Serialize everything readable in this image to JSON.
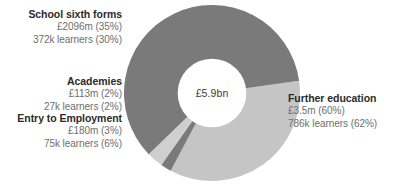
{
  "center": {
    "value": "£5.9bn"
  },
  "colors": {
    "light_grey": "#c5c5c5",
    "mid_light_grey": "#cfcfcf",
    "dark_grey": "#7a7a7a",
    "mid_dark_grey": "#8a8a8a",
    "title_text": "#2b2b2b",
    "value_text": "#6e6e6e",
    "background": "#ffffff"
  },
  "labels": {
    "school": {
      "title": "School sixth forms",
      "amount": "£2096m (35%)",
      "learners": "372k learners (30%)"
    },
    "academies": {
      "title": "Academies",
      "amount": "£113m (2%)",
      "learners": "27k learners (2%)"
    },
    "entry": {
      "title": "Entry to Employment",
      "amount": "£180m (3%)",
      "learners": "75k learners (6%)"
    },
    "further": {
      "title": "Further education",
      "amount": "£3.5m (60%)",
      "learners": "786k learners (62%)"
    }
  },
  "chart_data": {
    "type": "pie",
    "title": "",
    "subtitle": "",
    "xlabel": "",
    "ylabel": "",
    "legend_position": "none",
    "grid": false,
    "donut": true,
    "inner_radius_ratio": 0.39,
    "center_label": "£5.9bn",
    "total_funding": "£5.9bn",
    "start_angle_deg": -8,
    "direction": "clockwise",
    "categories": [
      "School sixth forms",
      "Academies",
      "Entry to Employment",
      "Further education"
    ],
    "values": [
      35,
      2,
      3,
      60
    ],
    "series": [
      {
        "name": "Funding (% of total)",
        "unit": "%",
        "values": [
          35,
          2,
          3,
          60
        ]
      },
      {
        "name": "Funding (£)",
        "unit": "£",
        "values": [
          "£2096m",
          "£113m",
          "£180m",
          "£3.5m"
        ]
      },
      {
        "name": "Learners",
        "unit": "learners",
        "values": [
          "372k",
          "27k",
          "75k",
          "786k"
        ]
      },
      {
        "name": "Learners (% of total)",
        "unit": "%",
        "values": [
          30,
          2,
          6,
          62
        ]
      }
    ],
    "slice_colors": [
      "#c5c5c5",
      "#7a7a7a",
      "#cfcfcf",
      "#7a7a7a"
    ]
  }
}
